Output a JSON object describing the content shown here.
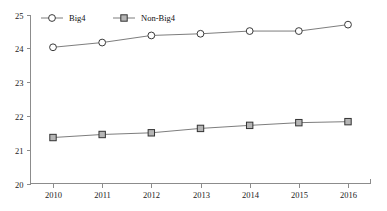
{
  "chart_data": {
    "type": "line",
    "title": "",
    "subtitle": "",
    "xlabel": "",
    "ylabel": "",
    "categories": [
      "2010",
      "2011",
      "2012",
      "2013",
      "2014",
      "2015",
      "2016"
    ],
    "x": [
      2010,
      2011,
      2012,
      2013,
      2014,
      2015,
      2016
    ],
    "series": [
      {
        "name": "Big4",
        "marker": "open-circle",
        "color": "#3a3a3a",
        "values": [
          24.03,
          24.17,
          24.38,
          24.43,
          24.51,
          24.51,
          24.7
        ]
      },
      {
        "name": "Non-Big4",
        "marker": "filled-square",
        "color": "#b5b5b5",
        "values": [
          21.36,
          21.45,
          21.5,
          21.63,
          21.72,
          21.8,
          21.83
        ]
      }
    ],
    "ylim": [
      20,
      25
    ],
    "xlim": [
      2010,
      2016
    ],
    "ytick_labels": [
      "20",
      "21",
      "22",
      "23",
      "24",
      "25"
    ],
    "ytick_values": [
      20,
      21,
      22,
      23,
      24,
      25
    ],
    "xtick_labels": [
      "2010",
      "2011",
      "2012",
      "2013",
      "2014",
      "2015",
      "2016"
    ],
    "grid": false,
    "legend_position": "top-left",
    "legend_entries": [
      "Big4",
      "Non-Big4"
    ]
  },
  "colors": {
    "axis": "#8c8c8c",
    "line": "#6e6e6e",
    "big4_marker_fill": "#ffffff",
    "big4_marker_stroke": "#3a3a3a",
    "nonbig4_marker_fill": "#b5b5b5",
    "nonbig4_marker_stroke": "#333333",
    "text": "#222222",
    "background": "#ffffff"
  }
}
